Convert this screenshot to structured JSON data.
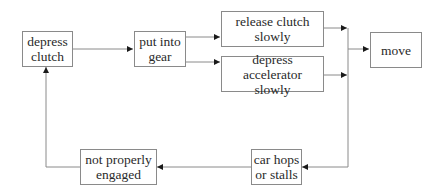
{
  "diagram": {
    "type": "flowchart",
    "nodes": [
      {
        "id": "depress_clutch",
        "label": "depress\nclutch"
      },
      {
        "id": "put_into_gear",
        "label": "put into\ngear"
      },
      {
        "id": "release_clutch",
        "label": "release clutch\nslowly"
      },
      {
        "id": "depress_accelerator",
        "label": "depress accelerator\nslowly"
      },
      {
        "id": "move",
        "label": "move"
      },
      {
        "id": "car_hops",
        "label": "car hops\nor stalls"
      },
      {
        "id": "not_engaged",
        "label": "not properly\nengaged"
      }
    ],
    "edges": [
      {
        "from": "depress_clutch",
        "to": "put_into_gear"
      },
      {
        "from": "put_into_gear",
        "to": "release_clutch"
      },
      {
        "from": "put_into_gear",
        "to": "depress_accelerator"
      },
      {
        "from": "release_clutch",
        "to": "move"
      },
      {
        "from": "depress_accelerator",
        "to": "move"
      },
      {
        "from": "release_clutch",
        "to": "car_hops"
      },
      {
        "from": "depress_accelerator",
        "to": "car_hops"
      },
      {
        "from": "car_hops",
        "to": "not_engaged"
      },
      {
        "from": "not_engaged",
        "to": "depress_clutch"
      }
    ],
    "colors": {
      "line": "#8a8a8a",
      "arrowhead": "#1a1a1a",
      "text": "#2a2a2a",
      "background": "#ffffff"
    }
  }
}
